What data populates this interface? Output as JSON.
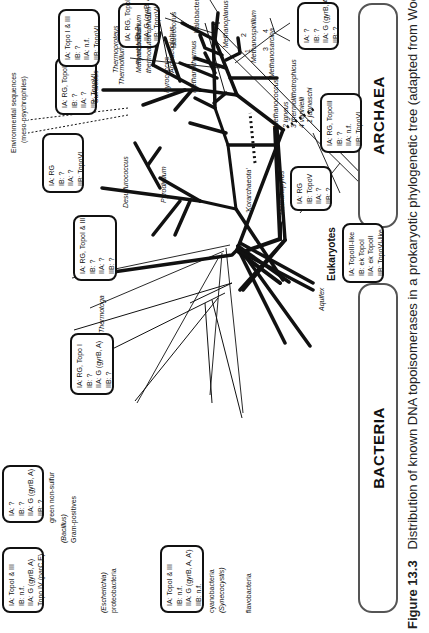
{
  "figure": {
    "caption_label": "Figure 13.3",
    "caption_text": "Distribution of known DNA topoisomerases in a prokaryotic phylogenetic tree (adapted from Woese"
  },
  "domains": {
    "bacteria": "BACTERIA",
    "archaea": "ARCHAEA",
    "eukaryotes": "Eukaryotes"
  },
  "taxa": {
    "aquifex": "Aquifex",
    "thermotoga": "Thermotoga",
    "green_non_sulfur": "green non-sulfur",
    "bacillus": "(Bacillus)",
    "gram_positives": "Gram-positives",
    "escherichia": "(Escherichia)",
    "proteobacteria": "proteobacteria",
    "cyanobacteria": "cyanobacteria",
    "synechocystis": "(Synecocystis)",
    "flavobacteria": "flavobacteria",
    "korarchaeota": "'Korarchaeota'",
    "environmental": "Environmental sequences",
    "meso_psychrophiles": "(meso-psychrophiles)",
    "pyrodictium": "Pyrodictium",
    "desulfurococcus": "Desulfurococcus",
    "sulfolobus": "Sulfolobus",
    "thermofilum": "Thermofilum",
    "thermoproteus": "Thermoproteus",
    "pyrobaculum": "Pyrobaculum",
    "pyrococcus": "Pyrococcus",
    "methanothermus": "Methanothermus",
    "methanobacterium": "Methanobacterium",
    "methanothermobacter": "thermoautotrophicum",
    "archaeoglobus": "Archaeoglobus",
    "halococcus": "Halococcus",
    "halobacterium": "Halobacterium",
    "methanoplanus": "Methanoplanus",
    "methanospirillum": "Methanospirillum",
    "methanosarcina": "Methanosarcina",
    "methanopyrus": "Methanopyrus",
    "methanococcus": "Methanococcus",
    "mc_1": "1 jannaschi",
    "mc_2": "2 igneus",
    "mc_3": "3 thermolithotrophicus",
    "mc_4": "4 vannielii",
    "num_1": "1",
    "num_2": "2",
    "num_3": "3",
    "num_4": "4"
  },
  "boxes": {
    "green_non_sulfur": [
      "IA: ?",
      "IB: ?",
      "IIA: G (gyrB, A)",
      "IIB: ?"
    ],
    "gram_pos": [
      "IA: TopoI & III",
      "IB: n.f.",
      "IIA: G (gyrB, A)",
      "Topo IV (parC,E)",
      "IIB: n.f."
    ],
    "cyano": [
      "IA: TopoI & III",
      "IB: n.f.",
      "IIA: G (gyrB, A, A')",
      "IIB: n.f."
    ],
    "thermotoga": [
      "IA: RG, Topo I",
      "IB: ?",
      "IIA: G (gyrB, A)",
      "IIB: ?"
    ],
    "desulfurococcus": [
      "IA: RG, TopoI & III",
      "IB: ?",
      "IIA: ?",
      "IIB: ?"
    ],
    "sulfolobus": [
      "IA: RG",
      "IB: ?",
      "IIA: ?",
      "IIB: TopoVI"
    ],
    "pyrococcus": [
      "IA: RG, TopoIII",
      "IB: ?",
      "IIA: ?",
      "IIB: TopoVI"
    ],
    "methanobacterium": [
      "IA: Topo I & III",
      "IB: ?",
      "IIA: n.f.",
      "IIB: TopoVI"
    ],
    "archaeoglobus": [
      "IA: RG, TopoIII",
      "IB: ?",
      "IIA: G (gyrB, A)",
      "IIB: TopoVI"
    ],
    "halo": [
      "IA: ?",
      "IB: ?",
      "IIA: G (gyrB, A)",
      "IIB: ?"
    ],
    "methanococcus": [
      "IA: RG, TopoIII",
      "IB: ?",
      "IIA: n.f.",
      "IIB: TopoVI"
    ],
    "methanopyrus": [
      "IA: RG",
      "IB: TopoV",
      "IIA: ?",
      "IIB: ?"
    ],
    "eukaryotes": [
      "IA: TopoIII-like",
      "IB: ek TopoI",
      "IIA: ek TopoII",
      "IIB: TopoVI-like"
    ]
  },
  "colors": {
    "line": "#111111",
    "pill_border": "#555555",
    "background": "#ffffff"
  }
}
